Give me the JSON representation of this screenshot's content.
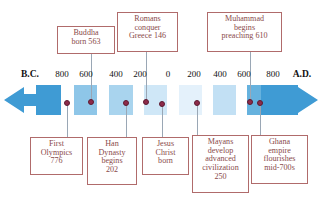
{
  "figure": {
    "type": "historical-timeline",
    "scale_unit": "years",
    "colors": {
      "box_border": "#b06b6b",
      "box_text": "#8a4a4a",
      "leader_line": "#9aa7b5",
      "dot": "#8e2b4a",
      "band_dark": "#3f9bd4",
      "band_mid": "#8ec6e8",
      "band_light": "#bfdff4",
      "band_pale": "#e4f1fb",
      "axis_text": "#111111",
      "background": "#ffffff"
    }
  },
  "axis": {
    "start_label": "B.C.",
    "end_label": "A.D.",
    "ticks": [
      {
        "label": "B.C.",
        "bold": true,
        "x": 30
      },
      {
        "label": "800",
        "bold": false,
        "x": 62
      },
      {
        "label": "600",
        "bold": false,
        "x": 86
      },
      {
        "label": "400",
        "bold": false,
        "x": 116
      },
      {
        "label": "200",
        "bold": false,
        "x": 140
      },
      {
        "label": "0",
        "bold": false,
        "x": 168
      },
      {
        "label": "200",
        "bold": false,
        "x": 194
      },
      {
        "label": "400",
        "bold": false,
        "x": 220
      },
      {
        "label": "600",
        "bold": false,
        "x": 244
      },
      {
        "label": "800",
        "bold": false,
        "x": 273
      },
      {
        "label": "A.D.",
        "bold": true,
        "x": 302
      }
    ]
  },
  "bands": [
    {
      "x": 36,
      "w": 25,
      "color": "#3f9bd4"
    },
    {
      "x": 61,
      "w": 13,
      "color": "#ffffff"
    },
    {
      "x": 74,
      "w": 23,
      "color": "#8ec6e8"
    },
    {
      "x": 97,
      "w": 12,
      "color": "#ffffff"
    },
    {
      "x": 109,
      "w": 24,
      "color": "#a9d4ee"
    },
    {
      "x": 133,
      "w": 11,
      "color": "#ffffff"
    },
    {
      "x": 144,
      "w": 23,
      "color": "#cfe7f7"
    },
    {
      "x": 167,
      "w": 12,
      "color": "#ffffff"
    },
    {
      "x": 179,
      "w": 23,
      "color": "#e4f1fb"
    },
    {
      "x": 202,
      "w": 11,
      "color": "#ffffff"
    },
    {
      "x": 213,
      "w": 23,
      "color": "#c2e0f4"
    },
    {
      "x": 236,
      "w": 11,
      "color": "#ffffff"
    },
    {
      "x": 247,
      "w": 22,
      "color": "#66b2de"
    },
    {
      "x": 269,
      "w": 9,
      "color": "#ffffff"
    },
    {
      "x": 278,
      "w": 20,
      "color": "#3f9bd4"
    }
  ],
  "events": [
    {
      "id": "first-olympics",
      "lines": [
        "First",
        "Olympics",
        "776"
      ],
      "year_label": "776",
      "era": "B.C.",
      "side": "bottom",
      "dot_x": 67,
      "dot_y": 103
    },
    {
      "id": "buddha-born",
      "lines": [
        "Buddha",
        "born 563"
      ],
      "year_label": "563",
      "era": "B.C.",
      "side": "top",
      "dot_x": 91,
      "dot_y": 102
    },
    {
      "id": "han-dynasty",
      "lines": [
        "Han",
        "Dynasty",
        "begins",
        "202"
      ],
      "year_label": "202",
      "era": "B.C.",
      "side": "bottom",
      "dot_x": 126,
      "dot_y": 103
    },
    {
      "id": "romans-conquer-greece",
      "lines": [
        "Romans",
        "conquer",
        "Greece 146"
      ],
      "year_label": "146",
      "era": "B.C.",
      "side": "top",
      "dot_x": 146,
      "dot_y": 102
    },
    {
      "id": "jesus-christ-born",
      "lines": [
        "Jesus",
        "Christ",
        "born"
      ],
      "year_label": "0",
      "era": "",
      "side": "bottom",
      "dot_x": 162,
      "dot_y": 104
    },
    {
      "id": "mayans-civilization",
      "lines": [
        "Mayans",
        "develop",
        "advanced",
        "civilization",
        "250"
      ],
      "year_label": "250",
      "era": "A.D.",
      "side": "bottom",
      "dot_x": 197,
      "dot_y": 103
    },
    {
      "id": "muhammad-preaching",
      "lines": [
        "Muhammad",
        "begins",
        "preaching 610"
      ],
      "year_label": "610",
      "era": "A.D.",
      "side": "top",
      "dot_x": 250,
      "dot_y": 102
    },
    {
      "id": "ghana-empire",
      "lines": [
        "Ghana",
        "empire",
        "flourishes",
        "mid-700s"
      ],
      "year_label": "mid-700s",
      "era": "A.D.",
      "side": "bottom",
      "dot_x": 260,
      "dot_y": 103
    }
  ],
  "callouts": {
    "top": [
      {
        "id": "buddha-born",
        "x": 57,
        "y": 26,
        "w": 58,
        "h": 28
      },
      {
        "id": "romans-conquer-greece",
        "x": 117,
        "y": 12,
        "w": 61,
        "h": 40
      },
      {
        "id": "muhammad-preaching",
        "x": 207,
        "y": 12,
        "w": 75,
        "h": 40
      }
    ],
    "bottom": [
      {
        "id": "first-olympics",
        "x": 30,
        "y": 137,
        "w": 53,
        "h": 38
      },
      {
        "id": "han-dynasty",
        "x": 87,
        "y": 137,
        "w": 50,
        "h": 48
      },
      {
        "id": "jesus-christ-born",
        "x": 142,
        "y": 137,
        "w": 47,
        "h": 38
      },
      {
        "id": "mayans-civilization",
        "x": 192,
        "y": 135,
        "w": 57,
        "h": 58
      },
      {
        "id": "ghana-empire",
        "x": 251,
        "y": 135,
        "w": 57,
        "h": 49
      }
    ]
  },
  "leaders": [
    {
      "id": "buddha-born",
      "x": 91,
      "y": 54,
      "h": 46
    },
    {
      "id": "romans-conquer-greece",
      "x": 146,
      "y": 52,
      "h": 48
    },
    {
      "id": "muhammad-preaching",
      "x": 250,
      "y": 52,
      "h": 48
    },
    {
      "id": "first-olympics",
      "x": 67,
      "y": 105,
      "h": 32
    },
    {
      "id": "han-dynasty",
      "x": 126,
      "y": 105,
      "h": 32
    },
    {
      "id": "jesus-christ-born",
      "x": 162,
      "y": 105,
      "h": 32
    },
    {
      "id": "mayans-civilization",
      "x": 197,
      "y": 105,
      "h": 30
    },
    {
      "id": "ghana-empire",
      "x": 260,
      "y": 105,
      "h": 30
    }
  ]
}
